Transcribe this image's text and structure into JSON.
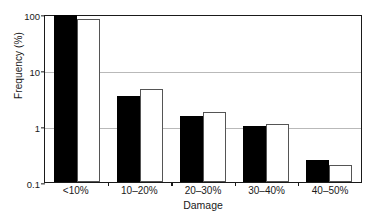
{
  "chart_data": {
    "type": "bar",
    "title": "",
    "xlabel": "Damage",
    "ylabel": "Frequency (%)",
    "categories": [
      "<10%",
      "10–20%",
      "20–30%",
      "30–40%",
      "40–50%"
    ],
    "yscale": "log",
    "ylim": [
      0.1,
      100
    ],
    "yticks": [
      0.1,
      1,
      10,
      100
    ],
    "ytick_labels": [
      "0.1",
      "1",
      "10",
      "100"
    ],
    "grid": "horizontal",
    "legend": "none",
    "series": [
      {
        "name": "series-filled",
        "fill": "#000000",
        "edge": "#000000",
        "values": [
          95,
          3.5,
          1.5,
          1.0,
          0.25
        ]
      },
      {
        "name": "series-open",
        "fill": "#ffffff",
        "edge": "#555555",
        "values": [
          83,
          4.5,
          1.8,
          1.1,
          0.2
        ]
      }
    ]
  },
  "colors": {
    "axis": "#1a1a1a",
    "grid": "#b9b9b9",
    "background": "#ffffff"
  }
}
